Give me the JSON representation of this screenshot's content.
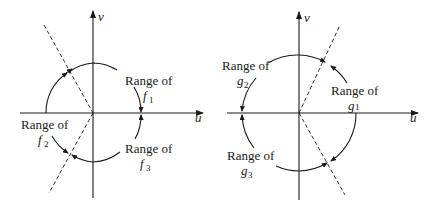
{
  "left_diagram": {
    "axes": {
      "horizontal": "u",
      "vertical": "v"
    },
    "ranges": [
      {
        "prefix": "Range of",
        "func": "f",
        "index": "1"
      },
      {
        "prefix": "Range of",
        "func": "f",
        "index": "2"
      },
      {
        "prefix": "Range of",
        "func": "f",
        "index": "3"
      }
    ]
  },
  "right_diagram": {
    "axes": {
      "horizontal": "u",
      "vertical": "v"
    },
    "ranges": [
      {
        "prefix": "Range of",
        "func": "g",
        "index": "1"
      },
      {
        "prefix": "Range of",
        "func": "g",
        "index": "2"
      },
      {
        "prefix": "Range of",
        "func": "g",
        "index": "3"
      }
    ]
  },
  "colors": {
    "ink": "#1a1a1a",
    "background": "#ffffff"
  }
}
